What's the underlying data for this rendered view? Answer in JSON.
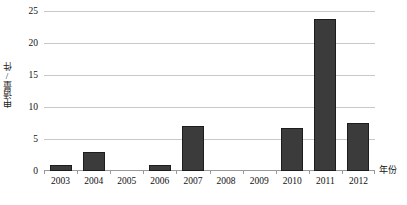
{
  "chart_data": {
    "type": "bar",
    "title": "",
    "subtitle": "",
    "xlabel": "年份",
    "ylabel": "申请量/件",
    "categories": [
      "2003",
      "2004",
      "2005",
      "2006",
      "2007",
      "2008",
      "2009",
      "2010",
      "2011",
      "2012"
    ],
    "values": [
      1,
      3,
      0,
      1,
      7,
      0,
      0,
      6.7,
      23.7,
      7.5
    ],
    "series": [
      {
        "name": "申请量",
        "values": [
          1,
          3,
          0,
          1,
          7,
          0,
          0,
          6.7,
          23.7,
          7.5
        ]
      }
    ],
    "ylim": [
      0,
      25
    ],
    "yticks": [
      0,
      5,
      10,
      15,
      20,
      25
    ],
    "ytick_labels": [
      "0",
      "5",
      "10",
      "15",
      "20",
      "25"
    ],
    "grid": true,
    "grid_axis": "y",
    "legend": false,
    "legend_position": "none",
    "bar_color": "#3b3b3b",
    "bar_edge_color": "#1d1d1d",
    "gridline_color": "#c8c8c8",
    "axis_color": "#9a9a9a",
    "background_color": "#ffffff",
    "annotations": []
  }
}
